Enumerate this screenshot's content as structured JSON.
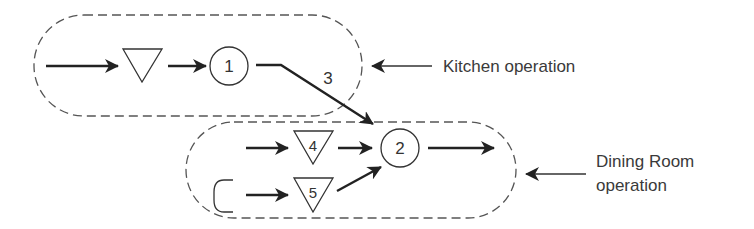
{
  "diagram": {
    "type": "process-flow",
    "groups": [
      {
        "id": "kitchen",
        "label": "Kitchen operation"
      },
      {
        "id": "dining",
        "label_line1": "Dining Room",
        "label_line2": "operation"
      }
    ],
    "nodes": [
      {
        "id": "storage-kitchen",
        "kind": "storage-triangle",
        "label": ""
      },
      {
        "id": "op1",
        "kind": "operation-circle",
        "label": "1"
      },
      {
        "id": "op2",
        "kind": "operation-circle",
        "label": "2"
      },
      {
        "id": "storage4",
        "kind": "storage-triangle",
        "label": "4"
      },
      {
        "id": "storage5",
        "kind": "storage-triangle",
        "label": "5"
      },
      {
        "id": "cup",
        "kind": "c-shape",
        "label": ""
      }
    ],
    "edges": [
      {
        "from": "input",
        "to": "storage-kitchen"
      },
      {
        "from": "storage-kitchen",
        "to": "op1"
      },
      {
        "from": "op1",
        "to": "op2",
        "label": "3"
      },
      {
        "from": "input",
        "to": "storage4"
      },
      {
        "from": "storage4",
        "to": "op2"
      },
      {
        "from": "cup",
        "to": "storage5"
      },
      {
        "from": "storage5",
        "to": "op2"
      },
      {
        "from": "op2",
        "to": "output"
      }
    ]
  }
}
